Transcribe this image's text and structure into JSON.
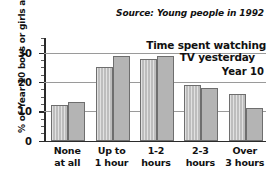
{
  "source_note": "Source: Young people in 1992",
  "title_line1": "Time spent watching",
  "title_line2": "TV yesterday",
  "legend_note": "Year 10",
  "ylabel": "% of Year 10 boys or girls asked",
  "chart_data": {
    "type": "bar",
    "title": "Time spent watching TV yesterday",
    "subtitle": "Source: Young people in 1992",
    "xlabel": "",
    "ylabel": "% of Year 10 boys or girls asked",
    "categories": [
      "None at all",
      "Up to 1 hour",
      "1-2 hours",
      "2-3 hours",
      "Over 3 hours"
    ],
    "category_lines": [
      [
        "None",
        "at all"
      ],
      [
        "Up to",
        "1 hour"
      ],
      [
        "1-2",
        "hours"
      ],
      [
        "2-3",
        "hours"
      ],
      [
        "Over",
        "3 hours"
      ]
    ],
    "series": [
      {
        "name": "boys",
        "values": [
          12,
          25,
          28,
          19,
          16
        ]
      },
      {
        "name": "girls",
        "values": [
          13,
          29,
          29,
          18,
          11
        ]
      }
    ],
    "ylim": [
      0,
      35
    ],
    "yticks": [
      0,
      10,
      20,
      30
    ],
    "ytick_labels": [
      "0",
      "10",
      "20",
      "30"
    ],
    "yminor_step": 2.5,
    "gridlines": [
      10,
      20,
      30
    ],
    "grid": true,
    "legend_position": "none",
    "annotation": "Year 10",
    "colors": {
      "series_a": "#bdbdbd",
      "series_b": "#b4b4b4",
      "bar_edge": "#6e6e6e",
      "axis": "#2b2b2b",
      "grid": "#9a9a9a",
      "text": "#111111",
      "background": "#ffffff"
    }
  }
}
